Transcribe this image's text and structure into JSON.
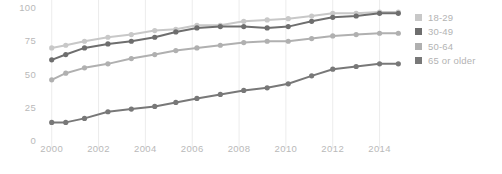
{
  "chart_data": {
    "type": "line",
    "title": "",
    "subtitle": "",
    "xlabel": "",
    "ylabel": "",
    "xlim": [
      1999.5,
      2015.0
    ],
    "ylim": [
      0,
      100
    ],
    "grid": "vertical",
    "legend_position": "right",
    "y_ticks": [
      100,
      75,
      50,
      25,
      0
    ],
    "x_ticks": [
      2000,
      2002,
      2004,
      2006,
      2008,
      2010,
      2012,
      2014
    ],
    "x": [
      2000,
      2000.6,
      2001.4,
      2002.4,
      2003.4,
      2004.4,
      2005.3,
      2006.2,
      2007.2,
      2008.2,
      2009.2,
      2010.1,
      2011.1,
      2012.0,
      2013.0,
      2014.0,
      2014.8
    ],
    "series": [
      {
        "name": "18-29",
        "color": "#c8c8c8",
        "values": [
          70,
          72,
          75,
          78,
          80,
          83,
          84,
          87,
          87,
          90,
          91,
          92,
          94,
          96,
          96,
          97,
          97
        ]
      },
      {
        "name": "30-49",
        "color": "#6e6e6e",
        "values": [
          61,
          65,
          70,
          73,
          75,
          78,
          82,
          85,
          86,
          86,
          85,
          86,
          90,
          93,
          94,
          96,
          96
        ]
      },
      {
        "name": "50-64",
        "color": "#b0b0b0",
        "values": [
          46,
          51,
          55,
          58,
          62,
          65,
          68,
          70,
          72,
          74,
          75,
          75,
          77,
          79,
          80,
          81,
          81
        ]
      },
      {
        "name": "65 or older",
        "color": "#787878",
        "values": [
          14,
          14,
          17,
          22,
          24,
          26,
          29,
          32,
          35,
          38,
          40,
          43,
          49,
          54,
          56,
          58,
          58
        ]
      }
    ]
  },
  "legend": {
    "items": [
      {
        "label": "18-29",
        "color": "#c8c8c8"
      },
      {
        "label": "30-49",
        "color": "#6e6e6e"
      },
      {
        "label": "50-64",
        "color": "#b0b0b0"
      },
      {
        "label": "65 or older",
        "color": "#787878"
      }
    ]
  },
  "axes": {
    "y_tick_labels": [
      "100",
      "75",
      "50",
      "25",
      "0"
    ],
    "x_tick_labels": [
      "2000",
      "2002",
      "2004",
      "2006",
      "2008",
      "2010",
      "2012",
      "2014"
    ]
  },
  "style": {
    "gridline_color": "#ececec",
    "tick_text_color": "#b9b9b9"
  }
}
